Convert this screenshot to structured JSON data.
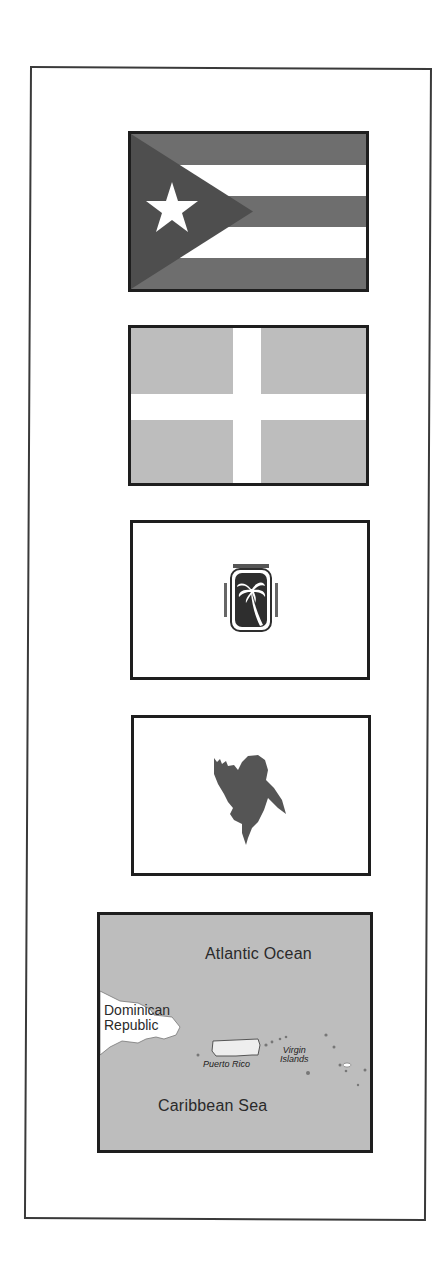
{
  "document": {
    "panels": [
      {
        "id": "flag-puerto-rico",
        "description": "Puerto Rico flag: five horizontal stripes with triangle and single star",
        "colors": {
          "stripe_dark": "#6e6e6e",
          "stripe_light": "#ffffff",
          "triangle": "#4e4e4e",
          "star": "#ffffff"
        }
      },
      {
        "id": "flag-white-cross",
        "description": "Gray flag with white cross",
        "colors": {
          "field": "#bdbdbd",
          "cross": "#ffffff"
        }
      },
      {
        "id": "flag-palm-seal",
        "description": "White flag with palm tree seal",
        "colors": {
          "field": "#ffffff",
          "seal": "#2e2e2e"
        }
      },
      {
        "id": "flag-jibaro-silhouette",
        "description": "White flag with silhouette of a man in a hat",
        "colors": {
          "field": "#ffffff",
          "silhouette": "#555555"
        }
      },
      {
        "id": "map-caribbean",
        "description": "Map of Puerto Rico region",
        "colors": {
          "water": "#bdbdbd",
          "land": "#ffffff"
        }
      }
    ],
    "map": {
      "labels": {
        "ocean_north": "Atlantic Ocean",
        "country_west_line1": "Dominican",
        "country_west_line2": "Republic",
        "island_main": "Puerto Rico",
        "islands_east_line1": "Virgin",
        "islands_east_line2": "Islands",
        "sea_south": "Caribbean Sea"
      }
    }
  }
}
